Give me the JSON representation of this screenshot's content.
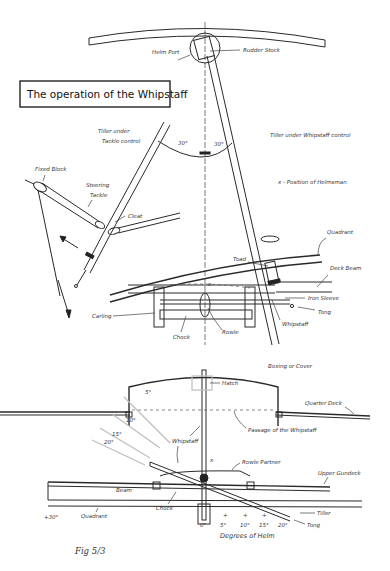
{
  "title": "The operation of the Whipstaff",
  "figure_caption": "Fig 5/3",
  "upper_diagram": {
    "labels": {
      "helm_port": "Helm Port",
      "rudder_stock": "Rudder Stock",
      "tiller_tackle": "Tiller under Tackle control",
      "tiller_tackle_line1": "Tiller under",
      "tiller_tackle_line2": "Tackle control",
      "tiller_whipstaff": "Tiller under Whipstaff control",
      "helmsman_key": "x - Position of Helmsman",
      "fixed_block": "Fixed Block",
      "steering_tackle_line1": "Steering",
      "steering_tackle_line2": "Tackle",
      "cleat": "Cleat",
      "quadrant": "Quadrant",
      "toad": "Toad",
      "deck_beam": "Deck Beam",
      "iron_sleeve": "Iron Sleeve",
      "tong": "Tong",
      "whipstaff": "Whipstaff",
      "rowle": "Rowle",
      "chock": "Chock",
      "carling": "Carling",
      "helmsman_mark": "x"
    },
    "angles": {
      "left": "30°",
      "right": "30°"
    }
  },
  "lower_diagram": {
    "labels": {
      "boxing": "Boxing or Cover",
      "hatch": "Hatch",
      "quarter_deck": "Quarter Deck",
      "passage": "Passage of the Whipstaff",
      "whipstaff": "Whipstaff",
      "rowle_partner": "Rowle Partner",
      "upper_gundeck": "Upper Gundeck",
      "beam": "Beam",
      "chock": "Chock",
      "quadrant": "Quadrant",
      "tiller": "Tiller",
      "tong": "Tong",
      "degrees_of_helm": "Degrees of Helm",
      "helmsman_mark": "x"
    },
    "whipstaff_angles": [
      "5°",
      "10°",
      "15°",
      "20°"
    ],
    "helm_degrees": [
      "0°",
      "5°",
      "10°",
      "15°",
      "20°"
    ],
    "far_left_degree": "+30°"
  }
}
